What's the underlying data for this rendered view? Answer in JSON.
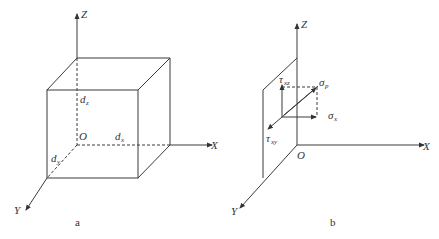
{
  "panels": [
    {
      "caption": "a",
      "axes": {
        "z": "Z",
        "x": "X",
        "y": "Y",
        "origin": "O"
      },
      "dimensions": {
        "dz": {
          "base": "d",
          "sub": "z"
        },
        "dx": {
          "base": "d",
          "sub": "x"
        },
        "dy": {
          "base": "d",
          "sub": "y"
        }
      }
    },
    {
      "caption": "b",
      "axes": {
        "z": "Z",
        "x": "X",
        "y": "Y",
        "origin": "O"
      },
      "stresses": {
        "sigma_p": {
          "base": "σ",
          "sub": "p"
        },
        "sigma_x": {
          "base": "σ",
          "sub": "x"
        },
        "tau_xz": {
          "base": "τ",
          "sub": "xz"
        },
        "tau_xy": {
          "base": "τ",
          "sub": "xy"
        }
      }
    }
  ]
}
